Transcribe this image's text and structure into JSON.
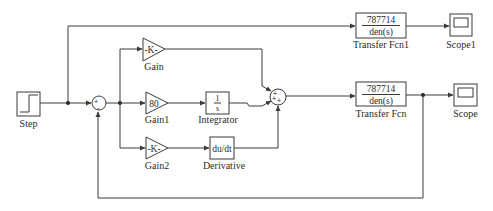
{
  "diagram": {
    "type": "simulink-block-diagram",
    "blocks": {
      "step": {
        "label": "Step"
      },
      "sum1": {
        "signs": [
          "+",
          "-"
        ]
      },
      "gain": {
        "label": "Gain",
        "value": "-K-"
      },
      "gain1": {
        "label": "Gain1",
        "value": "80"
      },
      "gain2": {
        "label": "Gain2",
        "value": "-K-"
      },
      "integrator": {
        "label": "Integrator",
        "numerator": "1",
        "denominator": "s"
      },
      "derivative": {
        "label": "Derivative",
        "value": "du/dt"
      },
      "sum2": {
        "signs": [
          "+",
          "+",
          "+"
        ]
      },
      "transfer_fcn1": {
        "label": "Transfer Fcn1",
        "numerator": "787714",
        "denominator": "den(s)"
      },
      "transfer_fcn": {
        "label": "Transfer Fcn",
        "numerator": "787714",
        "denominator": "den(s)"
      },
      "scope1": {
        "label": "Scope1"
      },
      "scope": {
        "label": "Scope"
      }
    },
    "connections": [
      [
        "Step",
        "Sum1"
      ],
      [
        "Step",
        "Transfer Fcn1"
      ],
      [
        "Sum1",
        "Gain"
      ],
      [
        "Sum1",
        "Gain1"
      ],
      [
        "Sum1",
        "Gain2"
      ],
      [
        "Gain1",
        "Integrator"
      ],
      [
        "Gain2",
        "Derivative"
      ],
      [
        "Gain",
        "Sum2"
      ],
      [
        "Integrator",
        "Sum2"
      ],
      [
        "Derivative",
        "Sum2"
      ],
      [
        "Sum2",
        "Transfer Fcn"
      ],
      [
        "Transfer Fcn1",
        "Scope1"
      ],
      [
        "Transfer Fcn",
        "Scope"
      ],
      [
        "Transfer Fcn",
        "Sum1 (feedback, -)"
      ]
    ],
    "colors": {
      "line": "#3a3a3a",
      "background": "#ffffff"
    }
  }
}
